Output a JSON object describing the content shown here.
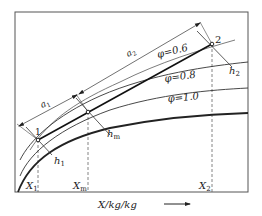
{
  "diagram": {
    "type": "psychrometric h-X mixing diagram",
    "x_axis_label": "X/kg/kg",
    "x_axis_arrow": "→",
    "x_ticks": {
      "x1": {
        "sym": "X",
        "sub": "1"
      },
      "xm": {
        "sym": "X",
        "sub": "m"
      },
      "x2": {
        "sym": "X",
        "sub": "2"
      }
    },
    "curves": [
      {
        "label": "φ=0.6"
      },
      {
        "label": "φ=0.8"
      },
      {
        "label": "φ=1.0"
      }
    ],
    "points": {
      "p1": "1",
      "p2": "2"
    },
    "enthalpy_lines": {
      "h1": {
        "sym": "h",
        "sub": "1"
      },
      "hm": {
        "sym": "h",
        "sub": "m"
      },
      "h2": {
        "sym": "h",
        "sub": "2"
      }
    },
    "dimensions": {
      "a1": {
        "sym": "a",
        "sub": "1"
      },
      "a2": {
        "sym": "a",
        "sub": "2"
      }
    },
    "colors": {
      "line": "#222222",
      "dashed": "#555555",
      "background": "#ffffff"
    }
  }
}
